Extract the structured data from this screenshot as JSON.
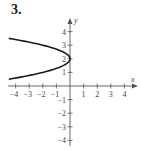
{
  "problem": {
    "number_label": "3."
  },
  "chart_data": {
    "type": "line",
    "title": "",
    "xlabel": "x",
    "ylabel": "y",
    "xlim": [
      -4.5,
      4.5
    ],
    "ylim": [
      -4.5,
      4.5
    ],
    "xticks": [
      -4,
      -3,
      -2,
      -1,
      1,
      2,
      3,
      4
    ],
    "yticks": [
      -4,
      -3,
      -2,
      -1,
      1,
      2,
      3,
      4
    ],
    "grid": false,
    "legend": null,
    "series": [
      {
        "name": "curve",
        "description": "Parabola opening left, vertex (0, 2), approx x = -2(y-2)^2",
        "points": [
          {
            "x": -4.5,
            "y": 3.5
          },
          {
            "x": -3,
            "y": 3.22
          },
          {
            "x": -2,
            "y": 3.0
          },
          {
            "x": -1,
            "y": 2.71
          },
          {
            "x": -0.5,
            "y": 2.5
          },
          {
            "x": 0,
            "y": 2
          },
          {
            "x": -0.5,
            "y": 1.5
          },
          {
            "x": -1,
            "y": 1.29
          },
          {
            "x": -2,
            "y": 1.0
          },
          {
            "x": -3,
            "y": 0.78
          },
          {
            "x": -4.5,
            "y": 0.5
          }
        ],
        "color": "#1a1a1a"
      }
    ]
  },
  "style": {
    "axis_color": "#555555",
    "curve_color": "#1a1a1a",
    "text_color": "#444444"
  }
}
